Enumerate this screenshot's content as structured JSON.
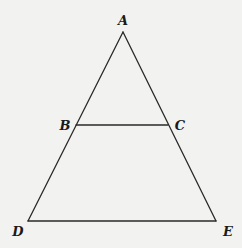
{
  "diagram": {
    "type": "geometry",
    "background": "#f2f2f0",
    "stroke_color": "#2a2a2a",
    "points": {
      "A": {
        "label": "A",
        "x": 123,
        "y": 32,
        "label_x": 123,
        "label_y": 21
      },
      "B": {
        "label": "B",
        "x": 76,
        "y": 125,
        "label_x": 65,
        "label_y": 126
      },
      "C": {
        "label": "C",
        "x": 168,
        "y": 125,
        "label_x": 180,
        "label_y": 126
      },
      "D": {
        "label": "D",
        "x": 28,
        "y": 221,
        "label_x": 18,
        "label_y": 232
      },
      "E": {
        "label": "E",
        "x": 216,
        "y": 221,
        "label_x": 228,
        "label_y": 232
      }
    },
    "segments": [
      {
        "name": "segment-AD",
        "from": "A",
        "to": "D"
      },
      {
        "name": "segment-AE",
        "from": "A",
        "to": "E"
      },
      {
        "name": "segment-DE",
        "from": "D",
        "to": "E"
      },
      {
        "name": "segment-BC",
        "from": "B",
        "to": "C"
      }
    ]
  }
}
